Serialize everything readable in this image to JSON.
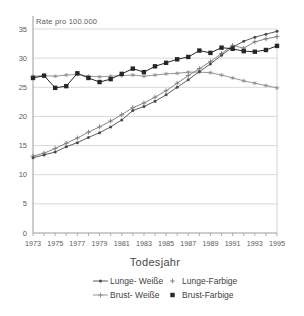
{
  "chart_data": {
    "type": "line",
    "title": "Rate pro 100.000",
    "xlabel": "Todesjahr",
    "ylabel": "",
    "xlim": [
      1973,
      1995
    ],
    "ylim": [
      0,
      35
    ],
    "x": [
      1973,
      1974,
      1975,
      1976,
      1977,
      1978,
      1979,
      1980,
      1981,
      1982,
      1983,
      1984,
      1985,
      1986,
      1987,
      1988,
      1989,
      1990,
      1991,
      1992,
      1993,
      1994,
      1995
    ],
    "x_tick_labels": [
      "1973",
      "1975",
      "1977",
      "1979",
      "1981",
      "1983",
      "1985",
      "1987",
      "1989",
      "1991",
      "1993",
      "1995"
    ],
    "y_ticks": [
      0,
      5,
      10,
      15,
      20,
      25,
      30,
      35
    ],
    "grid": "horizontal",
    "legend_position": "bottom",
    "series": [
      {
        "name": "Lunge- Weiße",
        "marker": "dot",
        "legend_glyph": "line-dot",
        "color": "#4a4a4a",
        "values": [
          12.9,
          13.4,
          13.9,
          14.8,
          15.5,
          16.4,
          17.2,
          18.2,
          19.4,
          21.0,
          21.7,
          22.6,
          23.7,
          25.0,
          26.3,
          27.7,
          29.0,
          30.5,
          31.9,
          32.9,
          33.6,
          34.1,
          34.6
        ]
      },
      {
        "name": "Lunge-Farbige",
        "marker": "plus",
        "legend_glyph": "plus",
        "color": "#787878",
        "values": [
          13.2,
          13.7,
          14.5,
          15.4,
          16.3,
          17.3,
          18.2,
          19.2,
          20.3,
          21.5,
          22.3,
          23.3,
          24.4,
          25.7,
          27.0,
          28.2,
          29.4,
          30.8,
          32.2,
          31.7,
          32.8,
          33.3,
          33.7
        ]
      },
      {
        "name": "Brust- Weiße",
        "marker": "star",
        "legend_glyph": "line-plus",
        "color": "#8c8c8c",
        "values": [
          26.9,
          27.0,
          26.9,
          27.1,
          27.2,
          26.9,
          26.8,
          26.9,
          27.0,
          27.1,
          26.9,
          27.1,
          27.3,
          27.4,
          27.6,
          27.6,
          27.5,
          27.1,
          26.6,
          26.1,
          25.7,
          25.3,
          24.9
        ]
      },
      {
        "name": "Brust-Farbige",
        "marker": "square",
        "legend_glyph": "square",
        "color": "#262626",
        "values": [
          26.6,
          27.0,
          24.9,
          25.2,
          27.4,
          26.6,
          25.9,
          26.4,
          27.3,
          28.2,
          27.6,
          28.6,
          29.2,
          29.8,
          30.2,
          31.3,
          30.9,
          31.8,
          31.6,
          31.2,
          31.1,
          31.4,
          32.1
        ]
      }
    ],
    "colors": {
      "grid": "#cfcfcf",
      "axis": "#9a9a9a",
      "tick_text": "#5a5a5a"
    }
  }
}
